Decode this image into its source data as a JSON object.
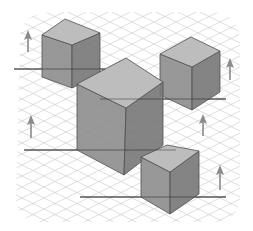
{
  "diagram": {
    "title": "",
    "colors": {
      "background": "#ffffff",
      "grid": "#c8c8c8",
      "top_face": "#bdbdbd",
      "left_face": "#8f8f8f",
      "right_face": "#7a7a7a",
      "edge": "#505050",
      "ground_line": "#3a3a3a",
      "arrow": "#8a8a8a"
    },
    "cubes": [
      {
        "name": "cube-top-left",
        "top": [
          65,
          19
        ],
        "left": [
          42,
          35
        ],
        "right": [
          100,
          33
        ],
        "front": [
          72,
          45
        ],
        "bl": [
          42,
          77
        ],
        "bf": [
          72,
          88
        ],
        "br": [
          100,
          75
        ]
      },
      {
        "name": "cube-top-right",
        "top": [
          191,
          37
        ],
        "left": [
          160,
          54
        ],
        "right": [
          220,
          51
        ],
        "front": [
          192,
          67
        ],
        "bl": [
          160,
          95
        ],
        "bf": [
          192,
          110
        ],
        "br": [
          220,
          92
        ]
      },
      {
        "name": "cube-large-center",
        "top": [
          126,
          58
        ],
        "left": [
          77,
          84
        ],
        "right": [
          163,
          82
        ],
        "front": [
          126,
          108
        ],
        "bl": [
          77,
          150
        ],
        "bf": [
          124,
          175
        ],
        "br": [
          163,
          145
        ]
      },
      {
        "name": "cube-bottom-right",
        "top": [
          167,
          145
        ],
        "left": [
          141,
          157
        ],
        "right": [
          199,
          151
        ],
        "front": [
          170,
          172
        ],
        "bl": [
          141,
          197
        ],
        "bf": [
          170,
          214
        ],
        "br": [
          199,
          194
        ]
      }
    ],
    "ground_lines": [
      {
        "x1": 14,
        "y1": 69,
        "x2": 105,
        "y2": 69
      },
      {
        "x1": 100,
        "y1": 99,
        "x2": 226,
        "y2": 99
      },
      {
        "x1": 24,
        "y1": 150,
        "x2": 176,
        "y2": 150
      },
      {
        "x1": 80,
        "y1": 197,
        "x2": 226,
        "y2": 197
      }
    ],
    "arrows": [
      {
        "x": 28,
        "y_top": 30,
        "y_bottom": 52
      },
      {
        "x": 31,
        "y_top": 115,
        "y_bottom": 138
      },
      {
        "x": 230,
        "y_top": 58,
        "y_bottom": 80
      },
      {
        "x": 203,
        "y_top": 114,
        "y_bottom": 136
      },
      {
        "x": 220,
        "y_top": 165,
        "y_bottom": 190
      }
    ]
  }
}
